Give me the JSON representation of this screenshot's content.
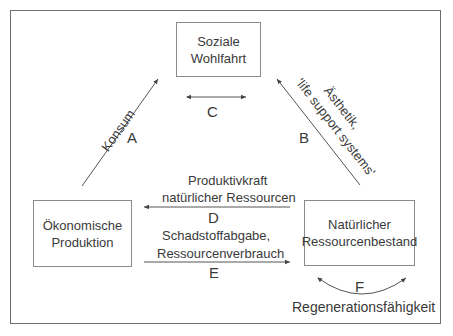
{
  "diagram": {
    "nodes": {
      "social": {
        "line1": "Soziale",
        "line2": "Wohlfahrt"
      },
      "economic": {
        "line1": "Ökonomische",
        "line2": "Produktion"
      },
      "natural": {
        "line1": "Natürlicher",
        "line2": "Ressourcenbestand"
      }
    },
    "edges": {
      "A": {
        "letter": "A",
        "label": "Konsum"
      },
      "B": {
        "letter": "B",
        "label_line1": "Ästhetik,",
        "label_line2": "'life support systems'"
      },
      "C": {
        "letter": "C"
      },
      "D": {
        "letter": "D",
        "label_line1": "Produktivkraft",
        "label_line2": "natürlicher Ressourcen"
      },
      "E": {
        "letter": "E",
        "label_line1": "Schadstoffabgabe,",
        "label_line2": "Ressourcenverbrauch"
      },
      "F": {
        "letter": "F",
        "label": "Regenerationsfähigkeit"
      }
    },
    "colors": {
      "line": "#555555",
      "box_border": "#8a8a8a",
      "text": "#3a3a3a"
    }
  }
}
